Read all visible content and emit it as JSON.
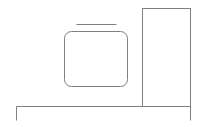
{
  "canvas": {
    "width": 198,
    "height": 127,
    "background": "#ffffff"
  },
  "stroke": {
    "color": "#808080",
    "width": 1
  },
  "shapes": {
    "top_line": {
      "x1": 76,
      "y1": 24,
      "x2": 116,
      "y2": 24
    },
    "rounded_box": {
      "x": 64,
      "y": 31,
      "width": 63,
      "height": 55,
      "rx": 7
    },
    "tall_rect": {
      "x": 142,
      "y": 8,
      "width": 48,
      "height": 98
    },
    "base_line": {
      "x1": 16,
      "y1": 106,
      "x2": 190,
      "y2": 106
    },
    "left_tick": {
      "x1": 16,
      "y1": 106,
      "x2": 16,
      "y2": 120
    },
    "right_tick": {
      "x1": 190,
      "y1": 106,
      "x2": 190,
      "y2": 120
    }
  }
}
